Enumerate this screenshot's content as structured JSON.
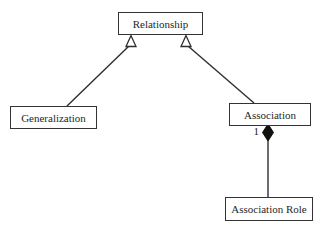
{
  "diagram": {
    "type": "uml-class-diagram",
    "background_color": "#ffffff",
    "line_color": "#2e2e2e",
    "text_color": "#1f1f1f",
    "diamond_fill_color": "#111111",
    "nodes": {
      "relationship": {
        "label": "Relationship"
      },
      "generalization": {
        "label": "Generalization"
      },
      "association": {
        "label": "Association"
      },
      "association_role": {
        "label": "Association Role"
      }
    },
    "edges": [
      {
        "from": "Generalization",
        "to": "Relationship",
        "type": "generalization",
        "arrow": "hollow-triangle"
      },
      {
        "from": "Association",
        "to": "Relationship",
        "type": "generalization",
        "arrow": "hollow-triangle"
      },
      {
        "from": "Association Role",
        "to": "Association",
        "type": "composition",
        "arrow": "filled-diamond",
        "multiplicity": "1"
      }
    ]
  }
}
